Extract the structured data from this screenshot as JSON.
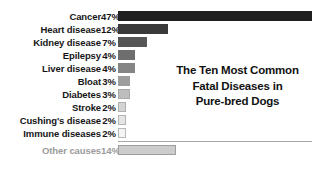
{
  "chart_data": {
    "type": "bar",
    "orientation": "horizontal",
    "title": "The Ten Most Common Fatal Diseases in Pure-bred Dogs",
    "title_lines": [
      "The Ten Most Common",
      "Fatal Diseases in",
      "Pure-bred Dogs"
    ],
    "xlabel": "",
    "ylabel": "",
    "xlim": [
      0,
      47
    ],
    "grid": false,
    "legend": false,
    "value_unit": "%",
    "categories": [
      "Cancer",
      "Heart disease",
      "Kidney disease",
      "Epilepsy",
      "Liver disease",
      "Bloat",
      "Diabetes",
      "Stroke",
      "Cushing's disease",
      "Immune diseases",
      "Other causes"
    ],
    "values": [
      47,
      12,
      7,
      4,
      4,
      3,
      3,
      2,
      2,
      2,
      14
    ],
    "value_labels": [
      "47%",
      "12%",
      "7%",
      "4%",
      "4%",
      "3%",
      "3%",
      "2%",
      "2%",
      "2%",
      "14%"
    ],
    "bars": [
      {
        "label": "Cancer",
        "value": 47,
        "value_label": "47%",
        "color": "#1f1f1f",
        "border": "#1f1f1f",
        "text_color": "#161616",
        "muted": false
      },
      {
        "label": "Heart disease",
        "value": 12,
        "value_label": "12%",
        "color": "#3a3a3a",
        "border": "#3a3a3a",
        "text_color": "#161616",
        "muted": false
      },
      {
        "label": "Kidney disease",
        "value": 7,
        "value_label": "7%",
        "color": "#565656",
        "border": "#565656",
        "text_color": "#161616",
        "muted": false
      },
      {
        "label": "Epilepsy",
        "value": 4,
        "value_label": "4%",
        "color": "#6e6e6e",
        "border": "#6e6e6e",
        "text_color": "#161616",
        "muted": false
      },
      {
        "label": "Liver disease",
        "value": 4,
        "value_label": "4%",
        "color": "#858585",
        "border": "#858585",
        "text_color": "#161616",
        "muted": false
      },
      {
        "label": "Bloat",
        "value": 3,
        "value_label": "3%",
        "color": "#9d9d9d",
        "border": "#9d9d9d",
        "text_color": "#161616",
        "muted": false
      },
      {
        "label": "Diabetes",
        "value": 3,
        "value_label": "3%",
        "color": "#bdbdbd",
        "border": "#a9a9a9",
        "text_color": "#161616",
        "muted": false
      },
      {
        "label": "Stroke",
        "value": 2,
        "value_label": "2%",
        "color": "#d4d4d4",
        "border": "#b0b0b0",
        "text_color": "#161616",
        "muted": false
      },
      {
        "label": "Cushing's disease",
        "value": 2,
        "value_label": "2%",
        "color": "#e6e6e6",
        "border": "#b4b4b4",
        "text_color": "#161616",
        "muted": false
      },
      {
        "label": "Immune diseases",
        "value": 2,
        "value_label": "2%",
        "color": "#f4f4f4",
        "border": "#b8b8b8",
        "text_color": "#161616",
        "muted": false
      },
      {
        "label": "Other causes",
        "value": 14,
        "value_label": "14%",
        "color": "#cccccc",
        "border": "#9e9e9e",
        "text_color": "#9b9b9b",
        "muted": true
      }
    ],
    "colors": {
      "background": "#ffffff",
      "text": "#161616",
      "muted_text": "#9b9b9b",
      "baseline": "#a8a8a8",
      "max_bar": "#1f1f1f",
      "min_bar": "#f4f4f4"
    }
  }
}
